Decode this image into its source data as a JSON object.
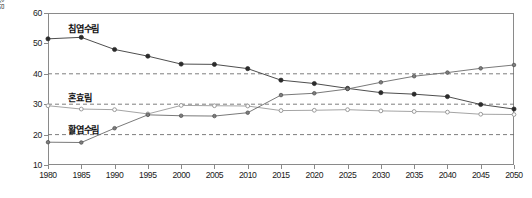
{
  "chart_data": {
    "type": "line",
    "title": "",
    "xlabel": "",
    "ylabel": "임상비율(%)",
    "x": [
      1980,
      1985,
      1990,
      1995,
      2000,
      2005,
      2010,
      2015,
      2020,
      2025,
      2030,
      2035,
      2040,
      2045,
      2050
    ],
    "xlim": [
      1980,
      2050
    ],
    "ylim": [
      10,
      60
    ],
    "yticks": [
      10,
      20,
      30,
      40,
      50,
      60
    ],
    "xticks": [
      "1980",
      "1985",
      "1990",
      "1995",
      "2000",
      "2005",
      "2010",
      "2015",
      "2020",
      "2025",
      "2030",
      "2035",
      "2040",
      "2045",
      "2050"
    ],
    "grid": "horizontal-dashed-at-20-30-40",
    "gridlines": [
      20,
      30,
      40
    ],
    "legend_position": "inline-labels",
    "series": [
      {
        "name": "침엽수림",
        "label_x": 1983,
        "label_y": 55.5,
        "color": "#3a3a3a",
        "marker": "filled-circle",
        "values": [
          51.5,
          52.0,
          48.0,
          45.8,
          43.2,
          43.1,
          41.7,
          37.9,
          36.8,
          35.2,
          33.8,
          33.3,
          32.5,
          29.9,
          28.4
        ]
      },
      {
        "name": "혼효림",
        "label_x": 1983,
        "label_y": 32.8,
        "color": "#9a9a9a",
        "marker": "open-circle",
        "values": [
          29.5,
          28.4,
          28.2,
          26.8,
          29.6,
          29.5,
          29.4,
          27.9,
          28.0,
          28.2,
          27.8,
          27.6,
          27.4,
          26.7,
          26.6
        ]
      },
      {
        "name": "활엽수림",
        "label_x": 1983,
        "label_y": 22.2,
        "color": "#6a6a6a",
        "marker": "small-circle",
        "values": [
          17.5,
          17.4,
          22.1,
          26.5,
          26.2,
          26.1,
          27.2,
          33.0,
          33.6,
          35.0,
          37.2,
          39.2,
          40.4,
          41.8,
          42.9
        ]
      }
    ]
  }
}
